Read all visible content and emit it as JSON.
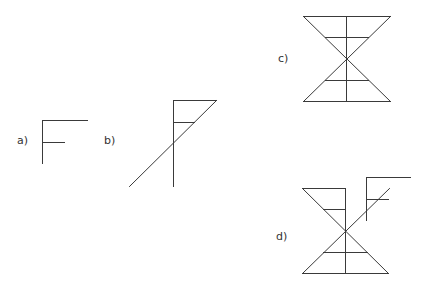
{
  "diagram": {
    "stroke_color": "#3a3a3a",
    "background": "#ffffff",
    "figures": [
      {
        "id": "a",
        "label": "a)",
        "label_pos": [
          17,
          144
        ],
        "description": "F-shaped figure",
        "lines": [
          [
            42,
            120,
            42,
            163
          ],
          [
            42,
            120,
            87,
            120
          ],
          [
            42,
            142,
            64,
            142
          ]
        ]
      },
      {
        "id": "b",
        "label": "b)",
        "label_pos": [
          104,
          144
        ],
        "description": "F-shape with diagonal closing into a triangle and extending downward",
        "lines": [
          [
            173,
            100,
            173,
            186
          ],
          [
            173,
            100,
            216,
            100
          ],
          [
            173,
            122,
            194,
            122
          ],
          [
            216,
            100,
            129,
            186
          ]
        ]
      },
      {
        "id": "c",
        "label": "c)",
        "label_pos": [
          278,
          62
        ],
        "description": "Hourglass of two triangles meeting at a point, with central vertical and crossbars",
        "lines": [
          [
            303,
            16,
            390,
            16
          ],
          [
            303,
            101,
            390,
            101
          ],
          [
            303,
            16,
            390,
            101
          ],
          [
            390,
            16,
            303,
            101
          ],
          [
            346,
            16,
            346,
            101
          ],
          [
            325,
            37,
            368,
            37
          ],
          [
            325,
            80,
            368,
            80
          ]
        ]
      },
      {
        "id": "d",
        "label": "d)",
        "label_pos": [
          276,
          240
        ],
        "description": "Hourglass with upper-right half replaced by shifted F-figure",
        "lines": [
          [
            302,
            188,
            345,
            188
          ],
          [
            345,
            188,
            345,
            273
          ],
          [
            302,
            188,
            388,
            273
          ],
          [
            323,
            209,
            345,
            209
          ],
          [
            302,
            273,
            388,
            273
          ],
          [
            323,
            252,
            367,
            252
          ],
          [
            302,
            273,
            389,
            188
          ],
          [
            366,
            177,
            366,
            220
          ],
          [
            366,
            177,
            410,
            177
          ],
          [
            366,
            199,
            388,
            199
          ]
        ]
      }
    ]
  }
}
